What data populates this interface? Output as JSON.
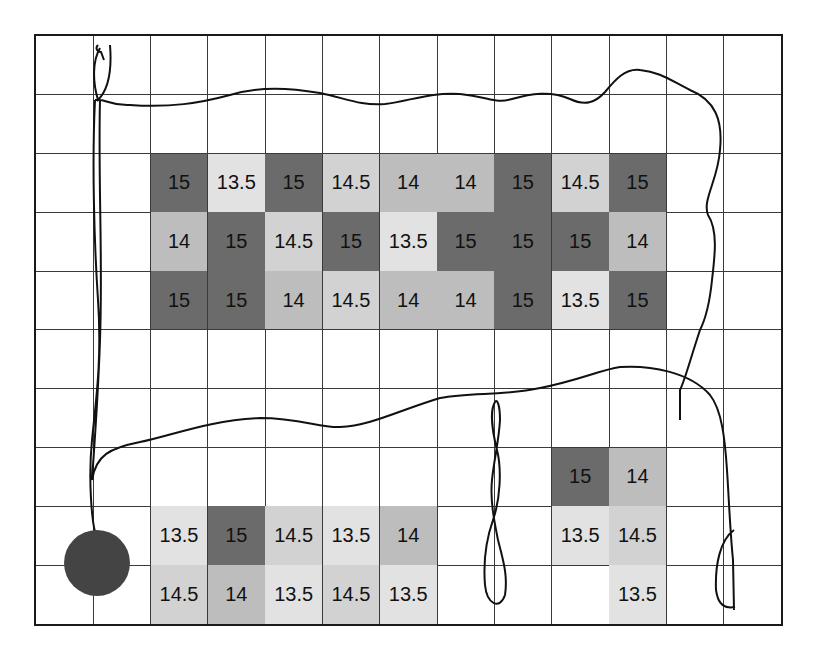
{
  "figure": {
    "grid": {
      "columns": 13,
      "rows": 10
    },
    "legend_colors": {
      "15": "#6b6b6b",
      "14.5": "#d2d2d2",
      "14": "#bdbdbd",
      "13.5": "#e2e2e2",
      "empty": "#ffffff"
    },
    "cells": [
      {
        "row": 2,
        "col": 2,
        "value": "15"
      },
      {
        "row": 2,
        "col": 3,
        "value": "13.5"
      },
      {
        "row": 2,
        "col": 4,
        "value": "15"
      },
      {
        "row": 2,
        "col": 5,
        "value": "14.5"
      },
      {
        "row": 2,
        "col": 6,
        "value": "14"
      },
      {
        "row": 2,
        "col": 7,
        "value": "14"
      },
      {
        "row": 2,
        "col": 8,
        "value": "15"
      },
      {
        "row": 2,
        "col": 9,
        "value": "14.5"
      },
      {
        "row": 2,
        "col": 10,
        "value": "15"
      },
      {
        "row": 3,
        "col": 2,
        "value": "14"
      },
      {
        "row": 3,
        "col": 3,
        "value": "15"
      },
      {
        "row": 3,
        "col": 4,
        "value": "14.5"
      },
      {
        "row": 3,
        "col": 5,
        "value": "15"
      },
      {
        "row": 3,
        "col": 6,
        "value": "13.5"
      },
      {
        "row": 3,
        "col": 7,
        "value": "15"
      },
      {
        "row": 3,
        "col": 8,
        "value": "15"
      },
      {
        "row": 3,
        "col": 9,
        "value": "15"
      },
      {
        "row": 3,
        "col": 10,
        "value": "14"
      },
      {
        "row": 4,
        "col": 2,
        "value": "15"
      },
      {
        "row": 4,
        "col": 3,
        "value": "15"
      },
      {
        "row": 4,
        "col": 4,
        "value": "14"
      },
      {
        "row": 4,
        "col": 5,
        "value": "14.5"
      },
      {
        "row": 4,
        "col": 6,
        "value": "14"
      },
      {
        "row": 4,
        "col": 7,
        "value": "14"
      },
      {
        "row": 4,
        "col": 8,
        "value": "15"
      },
      {
        "row": 4,
        "col": 9,
        "value": "13.5"
      },
      {
        "row": 4,
        "col": 10,
        "value": "15"
      },
      {
        "row": 7,
        "col": 9,
        "value": "15"
      },
      {
        "row": 7,
        "col": 10,
        "value": "14"
      },
      {
        "row": 8,
        "col": 2,
        "value": "13.5"
      },
      {
        "row": 8,
        "col": 3,
        "value": "15"
      },
      {
        "row": 8,
        "col": 4,
        "value": "14.5"
      },
      {
        "row": 8,
        "col": 5,
        "value": "13.5"
      },
      {
        "row": 8,
        "col": 6,
        "value": "14"
      },
      {
        "row": 8,
        "col": 9,
        "value": "13.5"
      },
      {
        "row": 8,
        "col": 10,
        "value": "14.5"
      },
      {
        "row": 9,
        "col": 2,
        "value": "14.5"
      },
      {
        "row": 9,
        "col": 3,
        "value": "14"
      },
      {
        "row": 9,
        "col": 4,
        "value": "13.5"
      },
      {
        "row": 9,
        "col": 5,
        "value": "14.5"
      },
      {
        "row": 9,
        "col": 6,
        "value": "13.5"
      },
      {
        "row": 9,
        "col": 10,
        "value": "13.5"
      }
    ],
    "marker": {
      "shape": "circle",
      "color": "#444444",
      "cx": 97,
      "cy": 563,
      "r": 33
    },
    "path_color": "#111111"
  }
}
